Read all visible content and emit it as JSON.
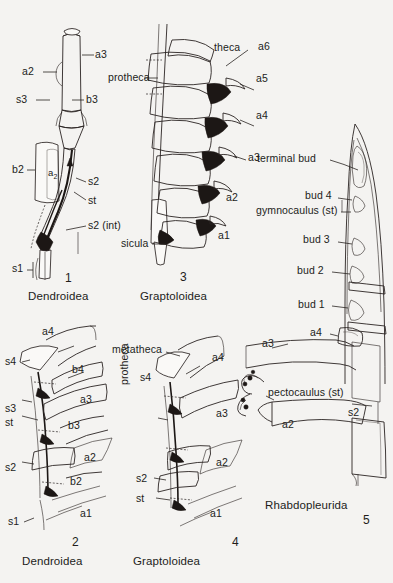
{
  "figure": {
    "background_color": "#f4f3f1",
    "ink_color": "#2a2422"
  },
  "panels": [
    {
      "id": "panel-1",
      "number": "1",
      "caption": "Dendroidea",
      "labels": [
        {
          "name": "a3",
          "text": "a3"
        },
        {
          "name": "a2",
          "text": "a2"
        },
        {
          "name": "s3",
          "text": "s3"
        },
        {
          "name": "b3",
          "text": "b3"
        },
        {
          "name": "b2",
          "text": "b2"
        },
        {
          "name": "a2-sub",
          "text": "a",
          "subscript": "2"
        },
        {
          "name": "s2",
          "text": "s2"
        },
        {
          "name": "st",
          "text": "st"
        },
        {
          "name": "s2-int",
          "text": "s2 (int)"
        },
        {
          "name": "s1",
          "text": "s1"
        }
      ]
    },
    {
      "id": "panel-3",
      "number": "3",
      "caption": "Graptoloidea",
      "labels": [
        {
          "name": "theca",
          "text": "theca"
        },
        {
          "name": "protheca",
          "text": "protheca"
        },
        {
          "name": "sicula",
          "text": "sicula"
        },
        {
          "name": "a6",
          "text": "a6"
        },
        {
          "name": "a5",
          "text": "a5"
        },
        {
          "name": "a4",
          "text": "a4"
        },
        {
          "name": "a3",
          "text": "a3"
        },
        {
          "name": "a2",
          "text": "a2"
        },
        {
          "name": "a1",
          "text": "a1"
        }
      ]
    },
    {
      "id": "panel-5",
      "number": "5",
      "caption": "Rhabdopleurida",
      "labels": [
        {
          "name": "terminal-bud",
          "text": "terminal  bud"
        },
        {
          "name": "bud-4",
          "text": "bud 4"
        },
        {
          "name": "gymnocaulus-st",
          "text": "gymnocaulus (st)"
        },
        {
          "name": "bud-3",
          "text": "bud 3"
        },
        {
          "name": "bud-2",
          "text": "bud 2"
        },
        {
          "name": "bud-1",
          "text": "bud 1"
        },
        {
          "name": "a4",
          "text": "a4"
        },
        {
          "name": "a3",
          "text": "a3"
        },
        {
          "name": "pectocaulus-st",
          "text": "pectocaulus (st)"
        },
        {
          "name": "s2",
          "text": "s2"
        },
        {
          "name": "a2",
          "text": "a2"
        }
      ]
    },
    {
      "id": "panel-2",
      "number": "2",
      "caption": "Dendroidea",
      "labels": [
        {
          "name": "a4",
          "text": "a4"
        },
        {
          "name": "b4",
          "text": "b4"
        },
        {
          "name": "s4",
          "text": "s4"
        },
        {
          "name": "a3",
          "text": "a3"
        },
        {
          "name": "b3",
          "text": "b3"
        },
        {
          "name": "s3",
          "text": "s3"
        },
        {
          "name": "st",
          "text": "st"
        },
        {
          "name": "a2",
          "text": "a2"
        },
        {
          "name": "b2",
          "text": "b2"
        },
        {
          "name": "s2",
          "text": "s2"
        },
        {
          "name": "s1",
          "text": "s1"
        },
        {
          "name": "a1",
          "text": "a1"
        }
      ]
    },
    {
      "id": "panel-4",
      "number": "4",
      "caption": "Graptoloidea",
      "labels": [
        {
          "name": "metatheca",
          "text": "metatheca"
        },
        {
          "name": "a4",
          "text": "a4"
        },
        {
          "name": "s4",
          "text": "s4"
        },
        {
          "name": "a3",
          "text": "a3"
        },
        {
          "name": "protheca",
          "text": "protheca"
        },
        {
          "name": "a2",
          "text": "a2"
        },
        {
          "name": "s2",
          "text": "s2"
        },
        {
          "name": "st",
          "text": "st"
        },
        {
          "name": "a1",
          "text": "a1"
        }
      ]
    }
  ]
}
